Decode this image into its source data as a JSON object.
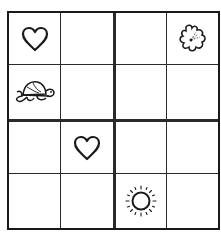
{
  "puzzle": {
    "type": "picture-sudoku-4x4",
    "size": 4,
    "symbols": [
      "heart",
      "flower",
      "turtle",
      "sun"
    ],
    "grid": [
      [
        "heart",
        "",
        "",
        "flower"
      ],
      [
        "turtle",
        "",
        "",
        ""
      ],
      [
        "",
        "heart",
        "",
        ""
      ],
      [
        "",
        "",
        "sun",
        ""
      ]
    ]
  },
  "colors": {
    "line": "#1a1a1a",
    "background": "#ffffff"
  }
}
